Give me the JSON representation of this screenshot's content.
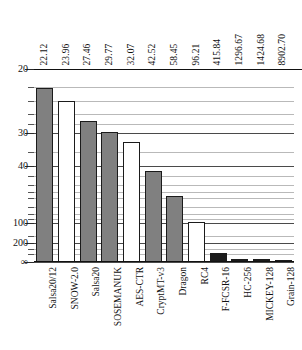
{
  "chart_data": {
    "type": "bar",
    "title": "",
    "subtitle": "",
    "xlabel": "",
    "ylabel": "",
    "categories": [
      "Salsa20/12",
      "SNOW-2.0",
      "Salsa20",
      "SOSEMANUK",
      "AES-CTR",
      "CryptMT-v3",
      "Dragon",
      "RC4",
      "F-FCSR-16",
      "HC-256",
      "MICKEY-128",
      "Grain-128"
    ],
    "values": [
      22.12,
      23.96,
      27.46,
      29.77,
      32.07,
      42.52,
      58.45,
      96.21,
      415.84,
      1296.67,
      1424.68,
      8902.7
    ],
    "value_labels": [
      "22.12",
      "23.96",
      "27.46",
      "29.77",
      "32.07",
      "42.52",
      "58.45",
      "96.21",
      "415.84",
      "1296.67",
      "1424.68",
      "8902.70"
    ],
    "bar_styles": [
      "gray",
      "white",
      "gray",
      "gray",
      "white",
      "gray",
      "gray",
      "white",
      "black",
      "black",
      "black",
      "black"
    ],
    "yaxis": {
      "scale": "reciprocal",
      "inverted": true,
      "tick_labels": [
        "20",
        "30",
        "40",
        "100",
        "200",
        "∞"
      ],
      "tick_values": [
        20,
        30,
        40,
        100,
        200,
        0
      ],
      "minor_tick_values": [
        22,
        24,
        26,
        28,
        35,
        45,
        50,
        55,
        60,
        70,
        80,
        90,
        150,
        300,
        500
      ],
      "grid": true,
      "grid_position": "horizontal"
    },
    "legend": {
      "visible": false,
      "entries": []
    }
  },
  "colors": {
    "bar_gray": "#808080",
    "bar_white": "#ffffff",
    "bar_black": "#1b1b1b",
    "bar_outline": "#1b1b1b",
    "grid_minor": "#b9b9b9",
    "grid_major": "#4a4a4a",
    "axis": "#111111",
    "background": "#ffffff"
  }
}
